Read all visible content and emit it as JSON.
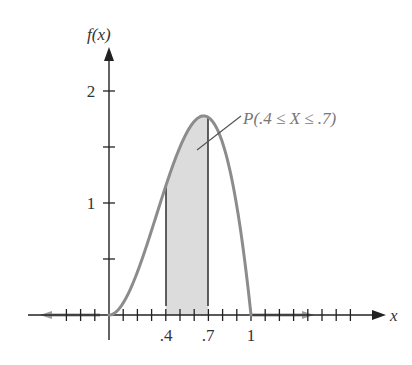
{
  "chart_data": {
    "type": "area",
    "title": "",
    "function": "f(x) = 12x^2(1 - x), 0 <= x <= 1",
    "xlabel": "x",
    "ylabel": "f(x)",
    "x_tick_labels": [
      ".4",
      ".7",
      "1"
    ],
    "x_tick_values": [
      0.4,
      0.7,
      1.0
    ],
    "x_tick_spacing": 0.1,
    "y_tick_labels": [
      "1",
      "2"
    ],
    "y_tick_values": [
      1,
      2
    ],
    "y_tick_spacing": 0.5,
    "xlim": [
      -0.6,
      1.95
    ],
    "ylim": [
      0,
      2.4
    ],
    "grid": false,
    "series": [
      {
        "name": "f(x)",
        "x": [
          0,
          0.1,
          0.2,
          0.3,
          0.4,
          0.5,
          0.6,
          0.667,
          0.7,
          0.8,
          0.9,
          1.0
        ],
        "values": [
          0,
          0.108,
          0.384,
          0.756,
          1.152,
          1.5,
          1.728,
          1.778,
          1.764,
          1.536,
          0.972,
          0
        ]
      }
    ],
    "shaded_region": {
      "from": 0.4,
      "to": 0.7,
      "label": "P(.4 ≤ X ≤ .7)"
    },
    "annotations": [
      "P(.4 ≤ X ≤ .7)"
    ]
  },
  "labels": {
    "y_axis": "f(x)",
    "x_axis": "x",
    "y_ticks": [
      "1",
      "2"
    ],
    "x_ticks": [
      ".4",
      ".7",
      "1"
    ],
    "annotation": "P(.4 ≤ X ≤ .7)"
  },
  "colors": {
    "curve": "#8c8c8c",
    "shade": "#dcdcdc",
    "axis": "#222222"
  }
}
